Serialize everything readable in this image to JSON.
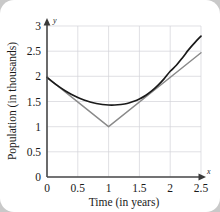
{
  "chart_data": {
    "type": "line",
    "title": "",
    "xlabel": "Time (in years)",
    "ylabel": "Population (in thousands)",
    "x_axis_symbol": "x",
    "y_axis_symbol": "y",
    "xlim": [
      0,
      2.5
    ],
    "ylim": [
      0,
      3
    ],
    "grid": true,
    "legend": "none",
    "xticks": [
      0,
      0.5,
      1,
      1.5,
      2,
      2.5
    ],
    "xtick_labels": [
      "0",
      "0.5",
      "1",
      "1.5",
      "2",
      "2.5"
    ],
    "yticks": [
      0,
      0.5,
      1,
      1.5,
      2,
      2.5,
      3
    ],
    "ytick_labels": [
      "0",
      "0.5",
      "1",
      "1.5",
      "2",
      "2.5",
      "3"
    ],
    "series": [
      {
        "name": "smooth-population-curve",
        "color": "#1a1a1a",
        "style": "solid",
        "x": [
          0,
          0.1,
          0.2,
          0.3,
          0.4,
          0.5,
          0.6,
          0.7,
          0.8,
          0.9,
          1.0,
          1.1,
          1.2,
          1.3,
          1.4,
          1.5,
          1.6,
          1.7,
          1.8,
          1.9,
          2.0,
          2.1,
          2.2,
          2.3,
          2.4,
          2.5
        ],
        "values": [
          1.98,
          1.88,
          1.79,
          1.71,
          1.64,
          1.58,
          1.53,
          1.49,
          1.46,
          1.44,
          1.43,
          1.43,
          1.44,
          1.46,
          1.5,
          1.55,
          1.62,
          1.71,
          1.82,
          1.95,
          2.1,
          2.22,
          2.37,
          2.53,
          2.67,
          2.8
        ]
      },
      {
        "name": "piecewise-linear-v",
        "color": "#8a8a8a",
        "style": "solid",
        "x": [
          0,
          1,
          2.5
        ],
        "values": [
          1.98,
          1.0,
          2.47
        ]
      }
    ],
    "annotations": []
  }
}
